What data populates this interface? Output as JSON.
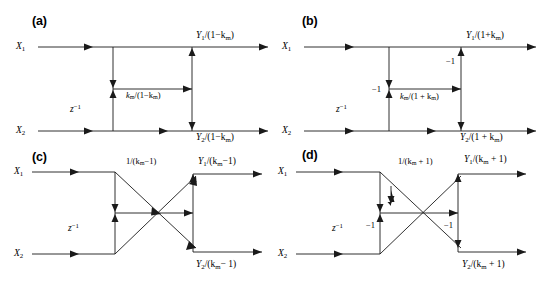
{
  "figure": {
    "type": "signal-flow-diagram",
    "panel_count": 4
  },
  "panels": {
    "a": {
      "tag": "(a)",
      "inputs": {
        "top": "X",
        "top_sub": "1",
        "bottom": "X",
        "bottom_sub": "2"
      },
      "delay_label": "z",
      "delay_exp": "−1",
      "branch_label_num": "k",
      "branch_label_sub": "m",
      "branch_label_den": "/(1−k",
      "branch_label_den_sub": "m",
      "branch_label_end": ")",
      "branch_label_full": "k_m/(1−k_m)",
      "output_top": "Y",
      "output_top_sub": "1",
      "output_top_den": "/(1−k",
      "output_top_den_sub": "m",
      "output_top_end": ")",
      "output_bottom": "Y",
      "output_bottom_sub": "2",
      "output_bottom_den": "/(1−k",
      "output_bottom_den_sub": "m",
      "output_bottom_end": ")",
      "gain_labels": []
    },
    "b": {
      "tag": "(b)",
      "inputs": {
        "top": "X",
        "top_sub": "1",
        "bottom": "X",
        "bottom_sub": "2"
      },
      "delay_label": "z",
      "delay_exp": "−1",
      "branch_label_num": "k",
      "branch_label_sub": "m",
      "branch_label_den": "/(1 + k",
      "branch_label_den_sub": "m",
      "branch_label_end": ")",
      "branch_label_full": "k_m/(1 + k_m)",
      "output_top": "Y",
      "output_top_sub": "1",
      "output_top_den": "/(1+k",
      "output_top_den_sub": "m",
      "output_top_end": ")",
      "output_bottom": "Y",
      "output_bottom_sub": "2",
      "output_bottom_den": "/(1 + k",
      "output_bottom_den_sub": "m",
      "output_bottom_end": ")",
      "gain_labels": [
        "−1",
        "−1"
      ]
    },
    "c": {
      "tag": "(c)",
      "inputs": {
        "top": "X",
        "top_sub": "1",
        "bottom": "X",
        "bottom_sub": "2"
      },
      "delay_label": "z",
      "delay_exp": "−1",
      "branch_label_num": "1/(k",
      "branch_label_sub": "m",
      "branch_label_den": "−1)",
      "branch_label_full": "1/(k_m−1)",
      "output_top": "Y",
      "output_top_sub": "1",
      "output_top_den": "/(k",
      "output_top_den_sub": "m",
      "output_top_end": "−1)",
      "output_bottom": "Y",
      "output_bottom_sub": "2",
      "output_bottom_den": "/(k",
      "output_bottom_den_sub": "m",
      "output_bottom_end": "− 1)",
      "gain_labels": []
    },
    "d": {
      "tag": "(d)",
      "inputs": {
        "top": "X",
        "top_sub": "1",
        "bottom": "X",
        "bottom_sub": "2"
      },
      "delay_label": "z",
      "delay_exp": "−1",
      "branch_label_num": "1/(k",
      "branch_label_sub": "m",
      "branch_label_den": " + 1)",
      "branch_label_full": "1/(k_m + 1)",
      "output_top": "Y",
      "output_top_sub": "1",
      "output_top_den": "/(k",
      "output_top_den_sub": "m",
      "output_top_end": " + 1)",
      "output_bottom": "Y",
      "output_bottom_sub": "2",
      "output_bottom_den": "/(k",
      "output_bottom_den_sub": "m",
      "output_bottom_end": " + 1)",
      "gain_labels": [
        "−1",
        "−1"
      ]
    }
  },
  "colors": {
    "stroke": "#1a1a1a",
    "background": "#ffffff",
    "text": "#000000"
  }
}
